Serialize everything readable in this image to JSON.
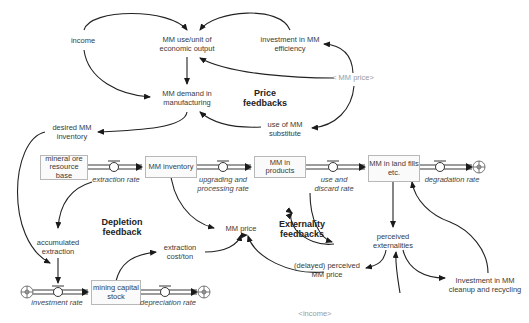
{
  "diagram": {
    "type": "stock-and-flow",
    "stocks": {
      "ore": "mineral ore resource base",
      "inventory": "MM inventory",
      "products": "MM in products",
      "landfills": "MM in land fills etc.",
      "capital": "mining capital stock"
    },
    "flows": {
      "extraction": "extraction rate",
      "upgrading": "upgrading and processing rate",
      "use_discard": "use and discard rate",
      "degradation": "degradation rate",
      "investment": "investment rate",
      "depreciation": "depreciation rate"
    },
    "variables": {
      "income": "income",
      "use_per_unit": "MM use/unit of economic output",
      "investment_efficiency": "investment in MM efficiency",
      "mm_price_shadow": "< MM price>",
      "demand": "MM demand in manufacturing",
      "substitute": "use of MM substitute",
      "desired_inventory": "desired MM inventory",
      "accumulated_extraction": "accumulated extraction",
      "mm_price": "MM price",
      "extraction_cost": "extraction cost/ton",
      "perceived_externalities": "perceived externalities",
      "delayed_price": "(delayed) perceived MM price",
      "cleanup_investment": "Investment in MM cleanup and recycling",
      "income_shadow": "<income>"
    },
    "loop_labels": {
      "price": "Price feedbacks",
      "depletion": "Depletion feedback",
      "externality": "Externality feedbacks"
    }
  }
}
